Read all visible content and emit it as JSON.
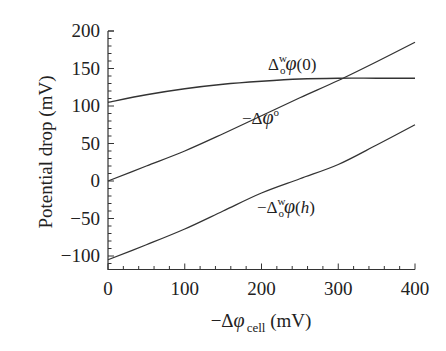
{
  "chart_data": {
    "type": "line",
    "title": "",
    "xlabel": "−Δφ_cell (mV)",
    "xlabel_parts": {
      "prefix": "−Δ",
      "symbol": "φ",
      "subscript": "cell",
      "unit": " (mV)"
    },
    "ylabel": "Potential drop (mV)",
    "xlim": [
      0,
      400
    ],
    "ylim": [
      -118,
      200
    ],
    "xticks": [
      0,
      100,
      200,
      300,
      400
    ],
    "yticks": [
      -100,
      -50,
      0,
      50,
      100,
      150,
      200
    ],
    "x_minor_step": 20,
    "y_minor_step": 10,
    "grid": false,
    "legend": "inline labels",
    "x": [
      0,
      50,
      100,
      150,
      200,
      250,
      300,
      350,
      400
    ],
    "series": [
      {
        "name": "Δ_o^w φ(0)",
        "label_parts": {
          "prefix": "Δ",
          "sub": "o",
          "sup": "w",
          "symbol": "φ",
          "arg": "(0)"
        },
        "values": [
          105,
          115,
          123,
          129,
          133,
          136,
          137,
          137,
          137
        ]
      },
      {
        "name": "−Δφ°",
        "label_parts": {
          "prefix": "−Δ",
          "symbol": "φ",
          "sup": "o"
        },
        "values": [
          0,
          20,
          40,
          63,
          87,
          111,
          134,
          159,
          185
        ]
      },
      {
        "name": "−Δ_o^w φ(h)",
        "label_parts": {
          "prefix": "−Δ",
          "sub": "o",
          "sup": "w",
          "symbol": "φ",
          "arg": "(h)"
        },
        "values": [
          -105,
          -85,
          -64,
          -40,
          -16,
          3,
          22,
          48,
          75
        ]
      }
    ]
  }
}
